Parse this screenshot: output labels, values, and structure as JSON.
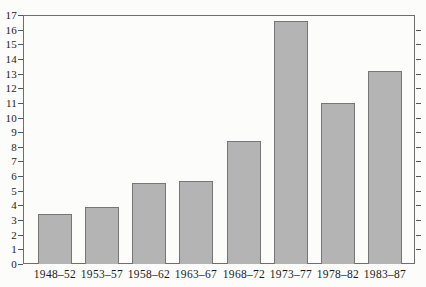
{
  "chart_data": {
    "type": "bar",
    "categories": [
      "1948–52",
      "1953–57",
      "1958–62",
      "1963–67",
      "1968–72",
      "1973–77",
      "1978–82",
      "1983–87"
    ],
    "values": [
      3.4,
      3.9,
      5.5,
      5.7,
      8.4,
      16.6,
      11.0,
      13.2
    ],
    "title": "",
    "xlabel": "",
    "ylabel": "",
    "ylim": [
      0,
      17
    ],
    "y_ticks": [
      0,
      1,
      2,
      3,
      4,
      5,
      6,
      7,
      8,
      9,
      10,
      11,
      12,
      13,
      14,
      15,
      16,
      17
    ],
    "grid": false,
    "legend": false,
    "colors": {
      "bar_fill": "#b4b4b4",
      "bar_border": "#767676",
      "frame": "#6e6e6e",
      "tick": "#555555",
      "text": "#1b1b1b",
      "background": "#fcfcfa"
    }
  }
}
